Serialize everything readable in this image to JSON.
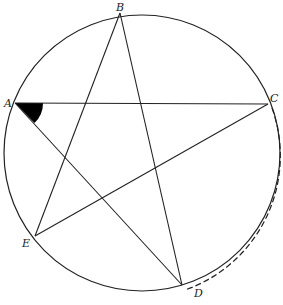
{
  "diagram": {
    "circle": {
      "cx": 142,
      "cy": 153,
      "r": 138
    },
    "points": [
      {
        "id": "A",
        "label": "A",
        "x": 15,
        "y": 103,
        "lx": 4,
        "ly": 106
      },
      {
        "id": "B",
        "label": "B",
        "x": 120,
        "y": 13,
        "lx": 116,
        "ly": 11
      },
      {
        "id": "C",
        "label": "C",
        "x": 268,
        "y": 104,
        "lx": 270,
        "ly": 102
      },
      {
        "id": "D",
        "label": "D",
        "x": 182,
        "y": 285,
        "lx": 193,
        "ly": 296
      },
      {
        "id": "E",
        "label": "E",
        "x": 35,
        "y": 236,
        "lx": 22,
        "ly": 246
      }
    ],
    "segments": [
      [
        "A",
        "C"
      ],
      [
        "C",
        "E"
      ],
      [
        "E",
        "B"
      ],
      [
        "B",
        "D"
      ],
      [
        "D",
        "A"
      ]
    ],
    "shaded_angle": {
      "vertex": "A",
      "between": [
        "C",
        "D"
      ],
      "color": "#000000"
    },
    "dashed_arc": {
      "from": "C",
      "to": "D",
      "description": "arc CD highlighted with dashed offset"
    },
    "colors": {
      "stroke": "#222222",
      "fill": "#000000",
      "background": "#ffffff"
    }
  }
}
